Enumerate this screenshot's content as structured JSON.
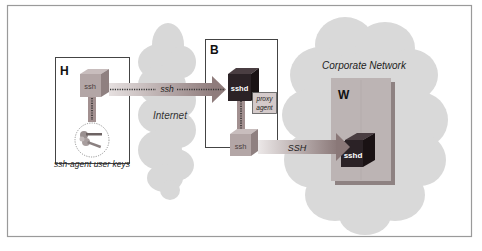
{
  "diagram": {
    "hosts": {
      "H": {
        "label": "H",
        "client": "ssh",
        "keys_caption": "ssh-agent user keys"
      },
      "B": {
        "label": "B",
        "server": "sshd",
        "proxy": [
          "proxy",
          "agent"
        ],
        "client": "ssh"
      },
      "W": {
        "label": "W",
        "server": "sshd"
      }
    },
    "clouds": {
      "internet": "Internet",
      "corporate": "Corporate Network"
    },
    "connections": {
      "h_to_b": "ssh",
      "b_to_w": "SSH"
    },
    "colors": {
      "frame": "#9a9a9a",
      "cloud": "#d9d9d9",
      "client_box": "#b3a6a6",
      "server_box": "#2b2226",
      "w_panel": "#b9b2b2",
      "arrow": "#9e8e8e"
    }
  }
}
